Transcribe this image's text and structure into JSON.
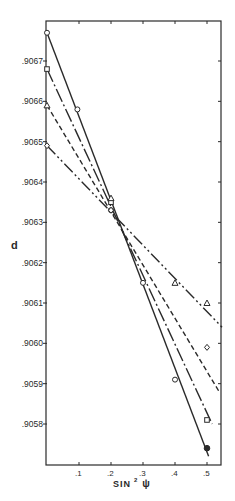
{
  "chart_data": {
    "type": "line",
    "title": "",
    "xlabel": "SIN² ψ",
    "xlabel_main": "SIN",
    "xlabel_sup": "2",
    "xlabel_symbol": "ψ",
    "ylabel": "d",
    "xlim": [
      0,
      0.547
    ],
    "ylim": [
      0.90571,
      0.90688
    ],
    "grid": false,
    "legend": "none",
    "x_ticks": [
      {
        "value": 0.1,
        "label": ".1"
      },
      {
        "value": 0.2,
        "label": ".2"
      },
      {
        "value": 0.3,
        "label": ".3"
      },
      {
        "value": 0.4,
        "label": ".4"
      },
      {
        "value": 0.5,
        "label": ".5"
      }
    ],
    "y_ticks": [
      {
        "value": 0.9058,
        "label": ".9058"
      },
      {
        "value": 0.9059,
        "label": ".9059"
      },
      {
        "value": 0.906,
        "label": ".9060"
      },
      {
        "value": 0.9061,
        "label": ".9061"
      },
      {
        "value": 0.9062,
        "label": ".9062"
      },
      {
        "value": 0.9063,
        "label": ".9063"
      },
      {
        "value": 0.9064,
        "label": ".9064"
      },
      {
        "value": 0.9065,
        "label": ".9065"
      },
      {
        "value": 0.9066,
        "label": ".9066"
      },
      {
        "value": 0.9067,
        "label": ".9067"
      }
    ],
    "series": [
      {
        "name": "circle-series",
        "line_style": "solid",
        "marker": "circle",
        "fit_line": [
          [
            0,
            0.90677
          ],
          [
            0.505,
            0.90572
          ]
        ],
        "points": [
          {
            "x": 0.0,
            "y": 0.90677
          },
          {
            "x": 0.095,
            "y": 0.90658
          },
          {
            "x": 0.2,
            "y": 0.90633
          },
          {
            "x": 0.3,
            "y": 0.90615
          },
          {
            "x": 0.4,
            "y": 0.90591
          },
          {
            "x": 0.5,
            "y": 0.90574,
            "filled": true
          }
        ]
      },
      {
        "name": "square-series",
        "line_style": "dash-dot",
        "marker": "square",
        "fit_line": [
          [
            0,
            0.90668
          ],
          [
            0.516,
            0.9058
          ]
        ],
        "points": [
          {
            "x": 0.0,
            "y": 0.90668
          },
          {
            "x": 0.2,
            "y": 0.90635
          },
          {
            "x": 0.5,
            "y": 0.90581
          }
        ]
      },
      {
        "name": "triangle-series",
        "line_style": "dashed",
        "marker": "triangle",
        "fit_line": [
          [
            0,
            0.90659
          ],
          [
            0.538,
            0.90588
          ]
        ],
        "points": [
          {
            "x": 0.0,
            "y": 0.90659
          },
          {
            "x": 0.2,
            "y": 0.90636
          },
          {
            "x": 0.4,
            "y": 0.90615
          },
          {
            "x": 0.5,
            "y": 0.9061
          }
        ]
      },
      {
        "name": "diamond-series",
        "line_style": "dash-dot-dot",
        "marker": "diamond",
        "fit_line": [
          [
            0,
            0.90649
          ],
          [
            0.547,
            0.90604
          ]
        ],
        "points": [
          {
            "x": 0.0,
            "y": 0.90649
          },
          {
            "x": 0.2,
            "y": 0.90633
          },
          {
            "x": 0.5,
            "y": 0.90599
          }
        ]
      }
    ]
  },
  "colors": {
    "ink": "#2a2a2a",
    "background": "#ffffff"
  }
}
